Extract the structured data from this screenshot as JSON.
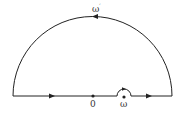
{
  "diagram": {
    "type": "contour",
    "labels": {
      "origin": "0",
      "pole": "ω",
      "arc": "ω",
      "arc_sup": "′"
    },
    "colors": {
      "stroke": "#222222",
      "background": "#ffffff"
    }
  }
}
